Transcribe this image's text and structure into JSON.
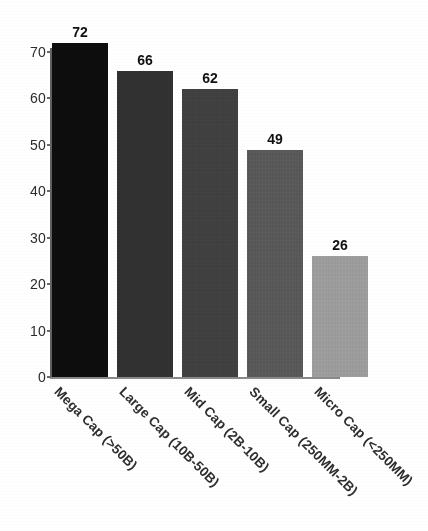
{
  "chart_data": {
    "type": "bar",
    "title": "",
    "subtitle": "",
    "xlabel": "",
    "ylabel": "",
    "categories": [
      "Mega Cap (>50B)",
      "Large Cap (10B-50B)",
      "Mid Cap (2B-10B)",
      "Small Cap (250MM-2B)",
      "Micro Cap (<250MM)"
    ],
    "values": [
      72,
      66,
      62,
      49,
      26
    ],
    "value_labels": [
      "72",
      "66",
      "62",
      "49",
      "26"
    ],
    "bar_colors": [
      "#0d0d0d",
      "#303030",
      "#3f3f3f",
      "#575757",
      "#9a9a9a"
    ],
    "ylim": [
      0,
      75
    ],
    "ytick_values": [
      0,
      10,
      20,
      30,
      40,
      50,
      60,
      70
    ],
    "ytick_labels": [
      "0",
      "10",
      "20",
      "30",
      "40",
      "50",
      "60",
      "70"
    ],
    "grid": false,
    "legend": false,
    "legend_position": "none",
    "xtick_rotation": -45,
    "axis_color": "#5e5e5e",
    "background": "#ffffff",
    "value_label_position": "above-bar"
  }
}
